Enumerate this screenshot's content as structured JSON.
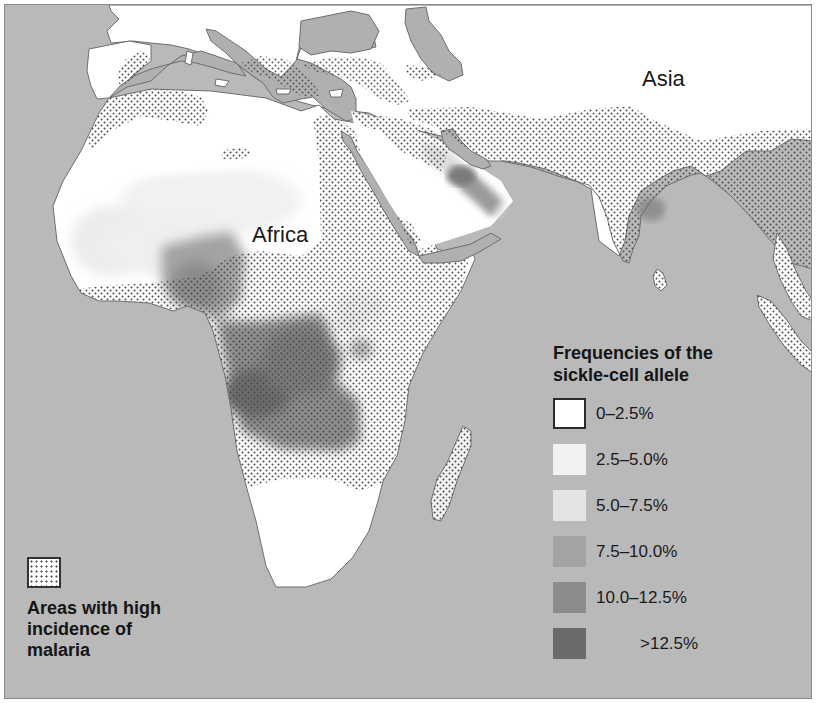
{
  "map": {
    "title": "Frequencies of the sickle-cell allele and areas with high incidence of malaria",
    "colors": {
      "ocean": "#b9b9b9",
      "land_base": "#ffffff",
      "coastline": "#6e6e6e",
      "stipple_dot": "#4a4a4a"
    },
    "region_labels": [
      {
        "id": "africa",
        "text": "Africa"
      },
      {
        "id": "asia",
        "text": "Asia"
      }
    ]
  },
  "legend_frequency": {
    "title_line1": "Frequencies of the",
    "title_line2": "sickle-cell allele",
    "items": [
      {
        "label": "0–2.5%",
        "color": "#ffffff"
      },
      {
        "label": "2.5–5.0%",
        "color": "#f1f1f1"
      },
      {
        "label": "5.0–7.5%",
        "color": "#e4e4e4"
      },
      {
        "label": "7.5–10.0%",
        "color": "#a3a3a3"
      },
      {
        "label": "10.0–12.5%",
        "color": "#8c8c8c"
      },
      {
        "label": ">12.5%",
        "color": "#6a6a6a"
      }
    ]
  },
  "legend_malaria": {
    "icon": "stipple-pattern-icon",
    "line1": "Areas with high",
    "line2": "incidence of",
    "line3": "malaria"
  }
}
